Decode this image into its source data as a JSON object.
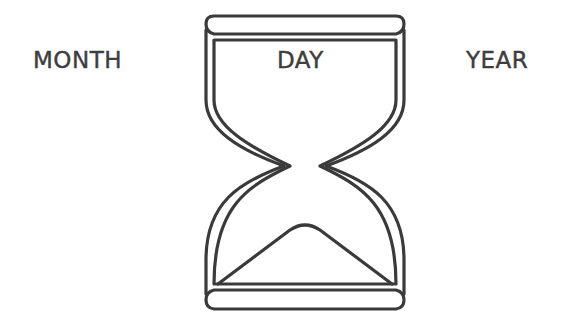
{
  "labels": {
    "month": "MONTH",
    "day": "DAY",
    "year": "YEAR"
  },
  "icon": {
    "name": "hourglass-icon",
    "stroke_color": "#3a3a3a",
    "fill_color": "#ffffff"
  }
}
